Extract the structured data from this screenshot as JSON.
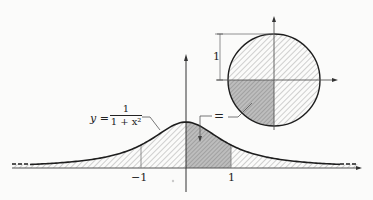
{
  "diagram": {
    "curve_label": {
      "lhs": "y =",
      "numerator": "1",
      "denominator": "1 + x²"
    },
    "ticks": {
      "neg_one": "−1",
      "pos_one": "1"
    },
    "circle": {
      "radius_label": "1"
    },
    "equals_label": "="
  },
  "colors": {
    "stroke": "#222222",
    "hatch_light": "#9a9a9a",
    "hatch_dark": "#8a8a8a",
    "dark_fill": "#b8b8b8",
    "background": "#fbfbfa"
  }
}
